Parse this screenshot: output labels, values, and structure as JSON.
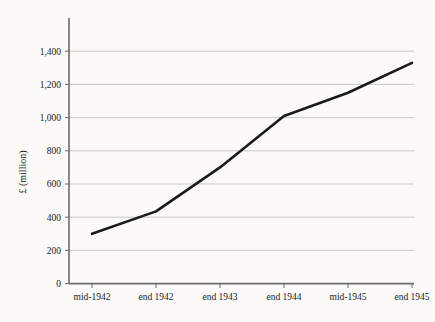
{
  "chart_data": {
    "type": "line",
    "title": "",
    "subtitle": "",
    "xlabel": "",
    "ylabel": "£ (million)",
    "categories": [
      "mid-1942",
      "end 1942",
      "end 1943",
      "end 1944",
      "mid-1945",
      "end 1945"
    ],
    "values": [
      300,
      435,
      700,
      1010,
      1150,
      1330
    ],
    "series": [
      {
        "name": "",
        "values": [
          300,
          435,
          700,
          1010,
          1150,
          1330
        ]
      }
    ],
    "ylim": [
      0,
      1400
    ],
    "yticks": [
      0,
      200,
      400,
      600,
      800,
      1000,
      1200,
      1400
    ],
    "ytick_labels": [
      "0",
      "200",
      "400",
      "600",
      "800",
      "1,000",
      "1,200",
      "1,400"
    ],
    "xtick_labels": [
      "mid-1942",
      "end 1942",
      "end 1943",
      "end 1944",
      "mid-1945",
      "end 1945"
    ],
    "grid": true,
    "grid_axis": "y",
    "legend": false,
    "legend_position": "none",
    "annotations": [],
    "colors": {
      "line": "#1a1a1a",
      "grid": "#c9c9c9",
      "axis": "#6b6b6b",
      "background": "#fbfaf8",
      "text": "#1a1a1a"
    }
  }
}
